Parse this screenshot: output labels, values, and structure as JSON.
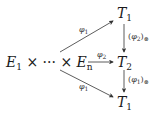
{
  "diagram": {
    "type": "commutative-diagram",
    "nodes": {
      "source": {
        "id": "product",
        "parts": [
          "E",
          "1",
          " × ··· × ",
          "E",
          "n"
        ],
        "text": "E1 × ··· × En"
      },
      "top": {
        "id": "T1-top",
        "base": "T",
        "sub": "1"
      },
      "middle": {
        "id": "T2",
        "base": "T",
        "sub": "2"
      },
      "bottom": {
        "id": "T1-bottom",
        "base": "T",
        "sub": "1"
      }
    },
    "edges": [
      {
        "from": "product",
        "to": "T1-top",
        "label_base": "φ",
        "label_sub": "1"
      },
      {
        "from": "product",
        "to": "T2",
        "label_base": "φ",
        "label_sub": "2"
      },
      {
        "from": "product",
        "to": "T1-bottom",
        "label_base": "φ",
        "label_sub": "1"
      },
      {
        "from": "T1-top",
        "to": "T2",
        "label_open": "(",
        "label_base": "φ",
        "label_sub": "2",
        "label_close": ")",
        "label_subscript_op": "⊗"
      },
      {
        "from": "T2",
        "to": "T1-bottom",
        "label_open": "(",
        "label_base": "φ",
        "label_sub": "1",
        "label_close": ")",
        "label_subscript_op": "⊗"
      }
    ],
    "colors": {
      "ink": "#1a1a1a",
      "arrow": "#333333",
      "background": "#ffffff"
    }
  }
}
